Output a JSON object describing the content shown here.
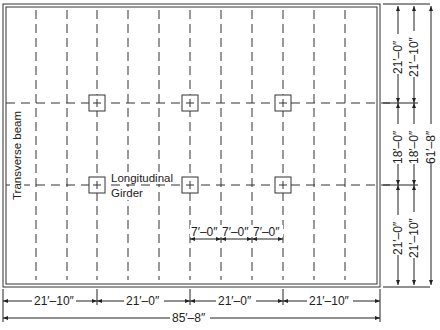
{
  "diagram": {
    "labels": {
      "transverse_beam": "Transverse beam",
      "longitudinal": "Longitudinal",
      "girder": "Girder"
    },
    "bottom_dims": {
      "spans": [
        "21′–10″",
        "21′–0″",
        "21′–0″",
        "21′–10″"
      ],
      "total": "85′–8″"
    },
    "spacing_dims": [
      "7′–0″",
      "7′–0″",
      "7′–0″"
    ],
    "right_dims": {
      "inner": [
        "21′–0″",
        "18′–0″",
        "21′–0″"
      ],
      "outer": [
        "21′–10″",
        "18′–0″",
        "21′–10″"
      ],
      "total": "61′–8″"
    }
  }
}
